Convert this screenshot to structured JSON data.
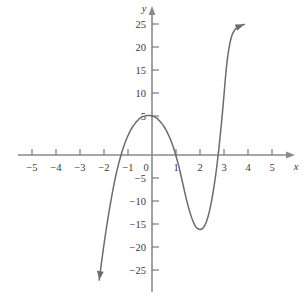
{
  "chart_data": {
    "type": "line",
    "title": "",
    "subtitle": "",
    "xlabel": "x",
    "ylabel": "y",
    "xlim": [
      -5.6,
      5.6
    ],
    "ylim": [
      -27.5,
      28.5
    ],
    "grid": false,
    "legend": null,
    "axis_style": "cartesian-arrows",
    "x_ticks": [
      -5,
      -4,
      -3,
      -2,
      -1,
      0,
      1,
      2,
      3,
      4,
      5
    ],
    "x_tick_labels": [
      "−5",
      "−4",
      "−3",
      "−2",
      "−1",
      "0",
      "1",
      "2",
      "3",
      "4",
      "5"
    ],
    "y_ticks": [
      25,
      20,
      15,
      10,
      5,
      -5,
      -10,
      -15,
      -20,
      -25
    ],
    "y_tick_labels": [
      "25",
      "20",
      "15",
      "10",
      "5",
      "−5",
      "−10",
      "−15",
      "−20",
      "−25"
    ],
    "series": [
      {
        "name": "cubic",
        "color": "#6b6b70",
        "roots": [
          -1.25,
          0.7,
          3.25
        ],
        "local_maximum": {
          "x": -0.3,
          "y": 10
        },
        "local_minimum": {
          "x": 2.15,
          "y": -16.2
        },
        "y_intercept": 8,
        "end_behavior": {
          "left": "down-arrow",
          "right": "up-arrow"
        },
        "x": [
          -2.2,
          -2.1,
          -2.0,
          -1.9,
          -1.8,
          -1.7,
          -1.6,
          -1.5,
          -1.4,
          -1.3,
          -1.2,
          -1.1,
          -1.0,
          -0.9,
          -0.8,
          -0.7,
          -0.6,
          -0.5,
          -0.4,
          -0.3,
          -0.2,
          -0.1,
          0.0,
          0.1,
          0.2,
          0.3,
          0.4,
          0.5,
          0.6,
          0.7,
          0.8,
          0.9,
          1.0,
          1.1,
          1.2,
          1.3,
          1.4,
          1.5,
          1.6,
          1.7,
          1.8,
          1.9,
          2.0,
          2.1,
          2.2,
          2.3,
          2.4,
          2.5,
          2.6,
          2.7,
          2.8,
          2.9,
          3.0,
          3.1,
          3.2,
          3.3,
          3.4,
          3.5,
          3.6,
          3.7,
          3.8,
          3.85
        ],
        "y": [
          -27.2,
          -23.2,
          -19.4,
          -15.9,
          -12.6,
          -9.6,
          -6.8,
          -4.3,
          -2.1,
          -0.2,
          1.5,
          3.0,
          4.2,
          5.3,
          6.2,
          6.9,
          7.5,
          8.0,
          8.3,
          8.5,
          8.6,
          8.6,
          8.5,
          8.3,
          8.0,
          7.5,
          6.9,
          6.2,
          5.3,
          4.2,
          3.0,
          1.5,
          -0.2,
          -2.1,
          -4.3,
          -6.6,
          -8.9,
          -11.0,
          -12.8,
          -14.3,
          -15.4,
          -16.0,
          -16.2,
          -16.0,
          -15.3,
          -14.0,
          -12.1,
          -9.5,
          -6.3,
          -2.5,
          2.0,
          7.2,
          13.1,
          19.0,
          23.0,
          25.5,
          26.8,
          27.5,
          27.9,
          28.1,
          28.3,
          28.4
        ]
      }
    ],
    "origin_label": "0"
  },
  "colors": {
    "curve": "#6b6b70",
    "axis": "#8a8a8f",
    "tick": "#6f6f74",
    "text": "#39393d",
    "background": "#ffffff"
  }
}
